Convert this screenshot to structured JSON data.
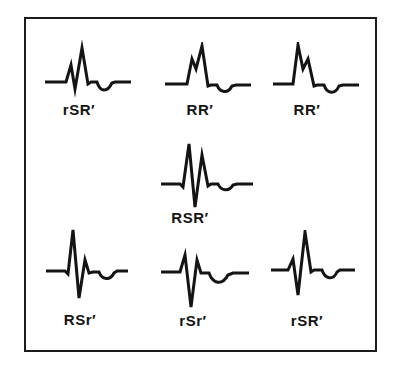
{
  "colors": {
    "ink": "#141414",
    "frame_border": "#1c1c1c",
    "background": "#ffffff"
  },
  "waveforms": [
    {
      "label": "rSR′",
      "path": "M1,42 L22,42 L27,25 L31,49 L38,8 L44,44 L47,42 L53,42 C56,52 63,53 68,43 L71,42 L87,42"
    },
    {
      "label": "RR′",
      "path": "M1,42 L23,42 L28,17 L32,27 L38,4 L44,44 L47,43 L53,43 C56,51 64,52 68,44 L72,43 L87,43"
    },
    {
      "label": "RR′",
      "path": "M1,42 L21,42 L26,3 L31,27 L36,17 L42,44 L45,43 L52,43 C55,52 63,53 67,44 L71,43 L87,43"
    },
    {
      "label": "RSR′",
      "path": "M1,48 L20,48 L23,51 L29,8 L35,71 L42,19 L48,50 L51,48 L58,48 C61,55 69,56 73,49 L77,48 L93,48"
    },
    {
      "label": "RSr′",
      "path": "M1,44 L20,44 L23,47 L28,3 L34,71 L40,33 L44,46 L48,45 L54,45 C57,53 65,54 69,46 L72,44 L83,44"
    },
    {
      "label": "rSr′",
      "path": "M1,40 L20,40 L25,23 L31,75 L37,28 L41,41 L49,41 C53,52 62,54 68,43 L73,41 L89,41"
    },
    {
      "label": "rSR′",
      "path": "M1,40 L18,40 L23,29 L28,65 L35,2 L41,42 L44,40 L52,40 C55,49 63,51 67,42 L70,40 L85,40"
    }
  ]
}
